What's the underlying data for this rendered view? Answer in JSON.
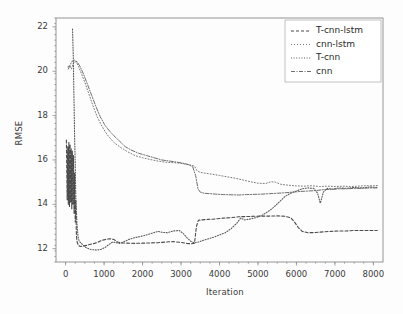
{
  "chart_data": {
    "type": "line",
    "title": "",
    "xlabel": "Iteration",
    "ylabel": "RMSE",
    "xlim": [
      -250,
      8250
    ],
    "ylim": [
      11.4,
      22.4
    ],
    "xticks": [
      0,
      1000,
      2000,
      3000,
      4000,
      5000,
      6000,
      7000,
      8000
    ],
    "yticks": [
      12,
      14,
      16,
      18,
      20,
      22
    ],
    "grid": false,
    "legend_position": "upper right",
    "series": [
      {
        "name": "T-cnn-lstm",
        "color": "#4a4a4a",
        "dash": "3,2",
        "width": 1.1,
        "points": [
          [
            20,
            16.9
          ],
          [
            40,
            14.2
          ],
          [
            55,
            16.6
          ],
          [
            70,
            14.0
          ],
          [
            85,
            16.8
          ],
          [
            100,
            13.9
          ],
          [
            115,
            16.7
          ],
          [
            130,
            14.1
          ],
          [
            145,
            16.5
          ],
          [
            160,
            13.8
          ],
          [
            175,
            16.4
          ],
          [
            190,
            14.0
          ],
          [
            205,
            16.2
          ],
          [
            220,
            13.6
          ],
          [
            235,
            15.4
          ],
          [
            250,
            13.2
          ],
          [
            265,
            14.2
          ],
          [
            280,
            12.6
          ],
          [
            300,
            12.3
          ],
          [
            330,
            12.15
          ],
          [
            380,
            12.1
          ],
          [
            450,
            12.12
          ],
          [
            550,
            12.15
          ],
          [
            650,
            12.2
          ],
          [
            750,
            12.24
          ],
          [
            850,
            12.3
          ],
          [
            950,
            12.38
          ],
          [
            1050,
            12.42
          ],
          [
            1150,
            12.45
          ],
          [
            1250,
            12.42
          ],
          [
            1350,
            12.3
          ],
          [
            1450,
            12.26
          ],
          [
            1600,
            12.25
          ],
          [
            1800,
            12.24
          ],
          [
            2000,
            12.25
          ],
          [
            2200,
            12.26
          ],
          [
            2400,
            12.27
          ],
          [
            2600,
            12.3
          ],
          [
            2800,
            12.32
          ],
          [
            3000,
            12.28
          ],
          [
            3150,
            12.24
          ],
          [
            3280,
            12.22
          ],
          [
            3350,
            12.25
          ],
          [
            3400,
            13.0
          ],
          [
            3450,
            13.28
          ],
          [
            3550,
            13.3
          ],
          [
            3700,
            13.32
          ],
          [
            3900,
            13.34
          ],
          [
            4100,
            13.38
          ],
          [
            4300,
            13.4
          ],
          [
            4500,
            13.44
          ],
          [
            4700,
            13.45
          ],
          [
            4900,
            13.46
          ],
          [
            5100,
            13.47
          ],
          [
            5300,
            13.47
          ],
          [
            5500,
            13.48
          ],
          [
            5700,
            13.46
          ],
          [
            5850,
            13.4
          ],
          [
            5950,
            13.2
          ],
          [
            6050,
            12.95
          ],
          [
            6150,
            12.78
          ],
          [
            6300,
            12.72
          ],
          [
            6500,
            12.73
          ],
          [
            6700,
            12.76
          ],
          [
            6900,
            12.78
          ],
          [
            7100,
            12.8
          ],
          [
            7300,
            12.8
          ],
          [
            7500,
            12.82
          ],
          [
            7700,
            12.82
          ],
          [
            7900,
            12.82
          ],
          [
            8100,
            12.82
          ]
        ]
      },
      {
        "name": "cnn-lstm",
        "color": "#7b7b7b",
        "dash": "1,2",
        "width": 1.0,
        "points": [
          [
            60,
            20.2
          ],
          [
            110,
            20.25
          ],
          [
            150,
            20.1
          ],
          [
            190,
            20.3
          ],
          [
            230,
            20.45
          ],
          [
            280,
            20.4
          ],
          [
            340,
            20.2
          ],
          [
            420,
            19.85
          ],
          [
            520,
            19.4
          ],
          [
            620,
            18.9
          ],
          [
            720,
            18.4
          ],
          [
            820,
            17.95
          ],
          [
            920,
            17.6
          ],
          [
            1020,
            17.3
          ],
          [
            1120,
            17.05
          ],
          [
            1250,
            16.8
          ],
          [
            1400,
            16.6
          ],
          [
            1600,
            16.38
          ],
          [
            1800,
            16.2
          ],
          [
            2000,
            16.1
          ],
          [
            2200,
            16.02
          ],
          [
            2400,
            15.95
          ],
          [
            2600,
            15.9
          ],
          [
            2800,
            15.88
          ],
          [
            3000,
            15.85
          ],
          [
            3150,
            15.8
          ],
          [
            3280,
            15.76
          ],
          [
            3350,
            15.72
          ],
          [
            3420,
            15.5
          ],
          [
            3500,
            15.44
          ],
          [
            3650,
            15.4
          ],
          [
            3800,
            15.36
          ],
          [
            4000,
            15.3
          ],
          [
            4200,
            15.24
          ],
          [
            4400,
            15.18
          ],
          [
            4600,
            15.1
          ],
          [
            4800,
            15.02
          ],
          [
            5000,
            14.95
          ],
          [
            5200,
            14.94
          ],
          [
            5350,
            15.02
          ],
          [
            5450,
            15.0
          ],
          [
            5600,
            14.9
          ],
          [
            5800,
            14.86
          ],
          [
            6000,
            14.83
          ],
          [
            6200,
            14.82
          ],
          [
            6400,
            14.84
          ],
          [
            6600,
            14.8
          ],
          [
            6800,
            14.82
          ],
          [
            7000,
            14.8
          ],
          [
            7200,
            14.82
          ],
          [
            7400,
            14.8
          ],
          [
            7600,
            14.82
          ],
          [
            7800,
            14.84
          ],
          [
            8000,
            14.84
          ],
          [
            8150,
            14.85
          ]
        ]
      },
      {
        "name": "T-cnn",
        "color": "#5a5a5a",
        "dash": "1,1.6",
        "width": 1.1,
        "points": [
          [
            180,
            21.9
          ],
          [
            200,
            20.6
          ],
          [
            215,
            19.0
          ],
          [
            230,
            17.4
          ],
          [
            245,
            16.2
          ],
          [
            258,
            15.0
          ],
          [
            270,
            14.0
          ],
          [
            285,
            13.5
          ],
          [
            300,
            13.0
          ],
          [
            320,
            12.6
          ],
          [
            350,
            12.35
          ],
          [
            400,
            12.25
          ],
          [
            460,
            12.15
          ],
          [
            530,
            12.05
          ],
          [
            620,
            11.98
          ],
          [
            720,
            11.95
          ],
          [
            820,
            11.94
          ],
          [
            920,
            11.97
          ],
          [
            1020,
            12.05
          ],
          [
            1120,
            12.18
          ],
          [
            1220,
            12.3
          ],
          [
            1300,
            12.28
          ],
          [
            1400,
            12.24
          ],
          [
            1500,
            12.3
          ],
          [
            1650,
            12.42
          ],
          [
            1800,
            12.5
          ],
          [
            1950,
            12.55
          ],
          [
            2100,
            12.62
          ],
          [
            2250,
            12.7
          ],
          [
            2400,
            12.78
          ],
          [
            2500,
            12.74
          ],
          [
            2650,
            12.72
          ],
          [
            2800,
            12.8
          ],
          [
            2950,
            12.82
          ],
          [
            3050,
            12.7
          ],
          [
            3150,
            12.5
          ],
          [
            3250,
            12.34
          ],
          [
            3350,
            12.26
          ],
          [
            3450,
            12.3
          ],
          [
            3550,
            12.36
          ],
          [
            3700,
            12.44
          ],
          [
            3850,
            12.52
          ],
          [
            4000,
            12.62
          ],
          [
            4150,
            12.72
          ],
          [
            4300,
            12.9
          ],
          [
            4450,
            13.15
          ],
          [
            4550,
            13.38
          ],
          [
            4650,
            13.3
          ],
          [
            4800,
            13.34
          ],
          [
            4950,
            13.4
          ],
          [
            5100,
            13.5
          ],
          [
            5250,
            13.66
          ],
          [
            5400,
            13.85
          ],
          [
            5550,
            14.1
          ],
          [
            5700,
            14.35
          ],
          [
            5850,
            14.5
          ],
          [
            6000,
            14.6
          ],
          [
            6150,
            14.7
          ],
          [
            6300,
            14.74
          ],
          [
            6450,
            14.72
          ],
          [
            6550,
            14.5
          ],
          [
            6620,
            14.05
          ],
          [
            6700,
            14.55
          ],
          [
            6800,
            14.72
          ],
          [
            6950,
            14.68
          ],
          [
            7100,
            14.74
          ],
          [
            7300,
            14.72
          ],
          [
            7500,
            14.76
          ],
          [
            7700,
            14.74
          ],
          [
            7900,
            14.78
          ],
          [
            8100,
            14.76
          ]
        ]
      },
      {
        "name": "cnn",
        "color": "#6e6e6e",
        "dash": "4,1.5,1,1.5",
        "width": 1.0,
        "points": [
          [
            70,
            20.1
          ],
          [
            120,
            20.3
          ],
          [
            170,
            20.45
          ],
          [
            230,
            20.5
          ],
          [
            300,
            20.42
          ],
          [
            380,
            20.2
          ],
          [
            470,
            19.85
          ],
          [
            570,
            19.4
          ],
          [
            680,
            18.9
          ],
          [
            790,
            18.4
          ],
          [
            900,
            17.95
          ],
          [
            1010,
            17.6
          ],
          [
            1120,
            17.35
          ],
          [
            1250,
            17.1
          ],
          [
            1400,
            16.85
          ],
          [
            1550,
            16.6
          ],
          [
            1700,
            16.45
          ],
          [
            1900,
            16.3
          ],
          [
            2100,
            16.2
          ],
          [
            2300,
            16.1
          ],
          [
            2500,
            16.0
          ],
          [
            2700,
            15.95
          ],
          [
            2900,
            15.9
          ],
          [
            3050,
            15.85
          ],
          [
            3180,
            15.8
          ],
          [
            3300,
            15.7
          ],
          [
            3380,
            15.3
          ],
          [
            3440,
            14.7
          ],
          [
            3500,
            14.55
          ],
          [
            3600,
            14.5
          ],
          [
            3750,
            14.48
          ],
          [
            3900,
            14.46
          ],
          [
            4100,
            14.44
          ],
          [
            4300,
            14.43
          ],
          [
            4500,
            14.42
          ],
          [
            4700,
            14.44
          ],
          [
            4900,
            14.45
          ],
          [
            5100,
            14.46
          ],
          [
            5300,
            14.48
          ],
          [
            5500,
            14.5
          ],
          [
            5700,
            14.52
          ],
          [
            5900,
            14.55
          ],
          [
            6100,
            14.58
          ],
          [
            6300,
            14.6
          ],
          [
            6500,
            14.62
          ],
          [
            6700,
            14.66
          ],
          [
            6900,
            14.68
          ],
          [
            7100,
            14.7
          ],
          [
            7300,
            14.7
          ],
          [
            7500,
            14.72
          ],
          [
            7700,
            14.72
          ],
          [
            7900,
            14.74
          ],
          [
            8100,
            14.74
          ]
        ]
      }
    ]
  },
  "axes": {
    "ylabel": "RMSE",
    "xlabel": "Iteration",
    "ytick_labels": [
      "12",
      "14",
      "16",
      "18",
      "20",
      "22"
    ],
    "xtick_labels": [
      "0",
      "1000",
      "2000",
      "3000",
      "4000",
      "5000",
      "6000",
      "7000",
      "8000"
    ]
  },
  "legend": {
    "entries": [
      {
        "label": "T-cnn-lstm"
      },
      {
        "label": "cnn-lstm"
      },
      {
        "label": "T-cnn"
      },
      {
        "label": "cnn"
      }
    ]
  },
  "colors": {
    "background": "#fdfdfd",
    "frame": "#8a8a8a",
    "text": "#3b3b3b"
  }
}
